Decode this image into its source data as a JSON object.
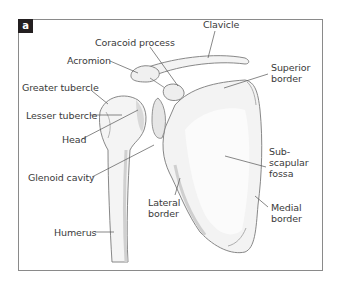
{
  "figure": {
    "panel_label": "a",
    "colors": {
      "frame": "#8a8a8a",
      "bone_fill": "#f2f2f2",
      "bone_shade": "#dcdcdc",
      "outline": "#777777",
      "leader": "#555555",
      "text": "#3a3a3a",
      "panel_label_bg": "#231f20"
    },
    "labels": {
      "clavicle": "Clavicle",
      "coracoid_process": "Coracoid process",
      "acromion": "Acromion",
      "superior_border": [
        "Superior",
        "border"
      ],
      "greater_tubercle": "Greater tubercle",
      "lesser_tubercle": "Lesser tubercle",
      "head": "Head",
      "glenoid_cavity": "Glenoid cavity",
      "subscapular_fossa": [
        "Sub-",
        "scapular",
        "fossa"
      ],
      "lateral_border": [
        "Lateral",
        "border"
      ],
      "medial_border": [
        "Medial",
        "border"
      ],
      "humerus": "Humerus"
    }
  }
}
